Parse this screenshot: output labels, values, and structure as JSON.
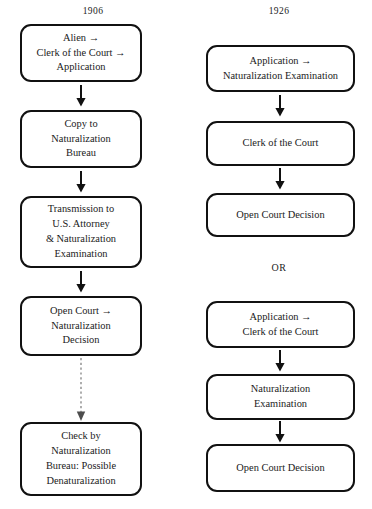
{
  "figure": {
    "type": "flowchart",
    "orientation": "two-column-vertical",
    "columns": [
      {
        "id": "col-1906",
        "year_label": "1906",
        "nodes": [
          {
            "id": "l1",
            "lines": [
              "Alien →",
              "Clerk of the Court →",
              "Application"
            ]
          },
          {
            "id": "l2",
            "lines": [
              "Copy to",
              "Naturalization",
              "Bureau"
            ]
          },
          {
            "id": "l3",
            "lines": [
              "Transmission to",
              "U.S. Attorney",
              "& Naturalization",
              "Examination"
            ]
          },
          {
            "id": "l4",
            "lines": [
              "Open Court →",
              "Naturalization",
              "Decision"
            ]
          },
          {
            "id": "l5",
            "lines": [
              "Check by",
              "Naturalization",
              "Bureau: Possible",
              "Denaturalization"
            ]
          }
        ],
        "connectors": [
          {
            "from": "l1",
            "to": "l2",
            "style": "solid",
            "glyph": "down-arrow"
          },
          {
            "from": "l2",
            "to": "l3",
            "style": "solid",
            "glyph": "down-arrow"
          },
          {
            "from": "l3",
            "to": "l4",
            "style": "solid",
            "glyph": "down-arrow"
          },
          {
            "from": "l4",
            "to": "l5",
            "style": "dotted",
            "glyph": "down-arrow"
          }
        ]
      },
      {
        "id": "col-1926",
        "year_label": "1926",
        "divider_label": "OR",
        "nodes_upper": [
          {
            "id": "r1",
            "lines": [
              "Application →",
              "Naturalization Examination"
            ]
          },
          {
            "id": "r2",
            "lines": [
              "Clerk of the Court"
            ]
          },
          {
            "id": "r3",
            "lines": [
              "Open Court Decision"
            ]
          }
        ],
        "nodes_lower": [
          {
            "id": "r4",
            "lines": [
              "Application →",
              "Clerk of the Court"
            ]
          },
          {
            "id": "r5",
            "lines": [
              "Naturalization",
              "Examination"
            ]
          },
          {
            "id": "r6",
            "lines": [
              "Open Court Decision"
            ]
          }
        ],
        "connectors_upper": [
          {
            "from": "r1",
            "to": "r2",
            "style": "solid",
            "glyph": "down-arrow"
          },
          {
            "from": "r2",
            "to": "r3",
            "style": "solid",
            "glyph": "down-arrow"
          }
        ],
        "connectors_lower": [
          {
            "from": "r4",
            "to": "r5",
            "style": "solid",
            "glyph": "down-arrow"
          },
          {
            "from": "r5",
            "to": "r6",
            "style": "solid",
            "glyph": "down-arrow"
          }
        ]
      }
    ],
    "colors": {
      "background": "#ffffff",
      "node_border": "#111111",
      "node_fill": "#ffffff",
      "text": "#1b1b1b",
      "solid_connector": "#111111",
      "dotted_connector": "#9a9a9a"
    }
  }
}
